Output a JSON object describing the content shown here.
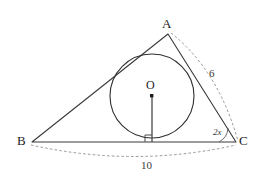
{
  "figure": {
    "kind": "triangle-with-inscribed-circle",
    "vertices": [
      {
        "name": "A",
        "label": "A",
        "x": 168,
        "y": 34
      },
      {
        "name": "B",
        "label": "B",
        "x": 32,
        "y": 142
      },
      {
        "name": "C",
        "label": "C",
        "x": 236,
        "y": 142
      }
    ],
    "center": {
      "name": "O",
      "label": "O",
      "x": 152,
      "y": 96
    },
    "incircle": {
      "cx": 152,
      "cy": 96,
      "r": 42
    },
    "radius_foot": {
      "x": 152,
      "y": 142
    },
    "labels": {
      "vertex_a": "A",
      "vertex_b": "B",
      "vertex_c": "C",
      "center_o": "O",
      "side_ac_length": "6",
      "side_bc_length": "10",
      "angle_at_c": "2x"
    },
    "colors": {
      "solid_line": "#3a3a3a",
      "circle_line": "#2f2f2f",
      "dashed_line": "#8c8c8c",
      "radius_line": "#4a4a4a",
      "text": "#1c1c1c",
      "background": "#ffffff"
    }
  }
}
